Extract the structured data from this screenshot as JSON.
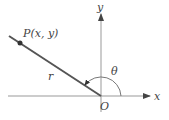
{
  "diagram": {
    "type": "polar-coordinates",
    "labels": {
      "point": "P(x, y)",
      "radius": "r",
      "angle": "θ",
      "origin": "O",
      "x_axis": "x",
      "y_axis": "y"
    },
    "colors": {
      "axis": "#888888",
      "ray": "#555555",
      "text": "#444444"
    }
  }
}
